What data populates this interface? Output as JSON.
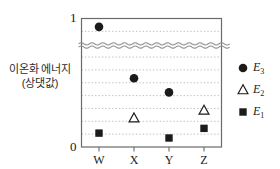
{
  "chart_data": {
    "type": "scatter",
    "title": "",
    "xlabel": "",
    "ylabel": "이온화 에너지 (상댓값)",
    "ylabel_line1": "이온화 에너지",
    "ylabel_line2": "(상댓값)",
    "categories": [
      "W",
      "X",
      "Y",
      "Z"
    ],
    "ylim": [
      0,
      1
    ],
    "ytick_labels": [
      "0",
      "1"
    ],
    "axis_break": true,
    "axis_break_value": 0.79,
    "grid": true,
    "grid_style": "dotted-horizontal",
    "legend_position": "right",
    "series": [
      {
        "name": "E₃",
        "label": "E",
        "subscript": "3",
        "marker": "filled-circle",
        "color": "#1b1b1b",
        "values": [
          0.935,
          0.535,
          0.425,
          null
        ]
      },
      {
        "name": "E₂",
        "label": "E",
        "subscript": "2",
        "marker": "open-triangle",
        "color": "#1b1b1b",
        "values": [
          null,
          0.225,
          null,
          0.285
        ]
      },
      {
        "name": "E₁",
        "label": "E",
        "subscript": "1",
        "marker": "filled-square",
        "color": "#1b1b1b",
        "values": [
          0.108,
          null,
          0.07,
          0.145
        ]
      }
    ]
  },
  "legend": {
    "items": [
      {
        "marker": "filled-circle",
        "label": "E",
        "subscript": "3"
      },
      {
        "marker": "open-triangle",
        "label": "E",
        "subscript": "2"
      },
      {
        "marker": "filled-square",
        "label": "E",
        "subscript": "1"
      }
    ]
  },
  "axes": {
    "y_top_label": "1",
    "y_bottom_label": "0"
  },
  "colors": {
    "marker": "#1b1b1b",
    "axis": "#555555",
    "grid": "#b9b9b9",
    "text": "#1a1a1a"
  }
}
